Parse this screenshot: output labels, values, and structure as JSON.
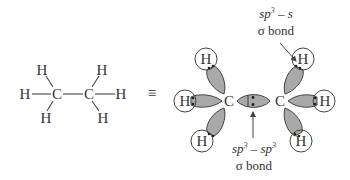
{
  "structural_formula": {
    "atoms": {
      "c1": "C",
      "c2": "C",
      "h_top_left": "H",
      "h_left": "H",
      "h_bottom_left": "H",
      "h_top_right": "H",
      "h_right": "H",
      "h_bottom_right": "H"
    }
  },
  "equivalence_symbol": "≡",
  "orbital_diagram": {
    "atoms": {
      "c1": "C",
      "c2": "C",
      "h_top_left": "H",
      "h_left": "H",
      "h_bottom_left": "H",
      "h_top_right": "H",
      "h_right": "H",
      "h_bottom_right": "H"
    },
    "labels": {
      "top": {
        "hybrid": "sp",
        "sup": "3",
        "rest": " – s",
        "bond": "σ bond"
      },
      "bottom": {
        "hybrid": "sp",
        "sup": "3",
        "mid": " – sp",
        "sup2": "3",
        "bond": "σ bond"
      }
    },
    "colors": {
      "lobe_fill": "#a9a9a9",
      "stroke": "#444444"
    }
  }
}
